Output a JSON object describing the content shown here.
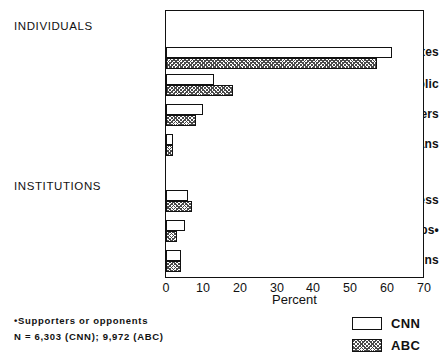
{
  "chart_data": {
    "type": "bar",
    "orientation": "horizontal",
    "title": "",
    "xlabel": "Percent",
    "ylabel": "",
    "xlim": [
      0,
      70
    ],
    "xticks": [
      0,
      10,
      20,
      30,
      40,
      50,
      60,
      70
    ],
    "grid": false,
    "legend_position": "bottom-right",
    "groups": [
      {
        "heading": "INDIVIDUALS",
        "categories": [
          "Candidates",
          "Voters/Public",
          "Campaign Workers",
          "Nonpartisans"
        ]
      },
      {
        "heading": "INSTITUTIONS",
        "categories": [
          "Press",
          "Organized Groups•",
          "Campaigns"
        ]
      }
    ],
    "categories": [
      "Candidates",
      "Voters/Public",
      "Campaign Workers",
      "Nonpartisans",
      "Press",
      "Organized Groups•",
      "Campaigns"
    ],
    "series": [
      {
        "name": "CNN",
        "values": [
          61,
          13,
          10,
          2,
          6,
          5,
          4
        ]
      },
      {
        "name": "ABC",
        "values": [
          57,
          18,
          8,
          2,
          7,
          3,
          4
        ]
      }
    ]
  },
  "labels": {
    "group_individuals": "INDIVIDUALS",
    "group_institutions": "INSTITUTIONS",
    "cat_candidates": "Candidates",
    "cat_voters_public": "Voters/Public",
    "cat_campaign_workers": "Campaign Workers",
    "cat_nonpartisans": "Nonpartisans",
    "cat_press": "Press",
    "cat_organized_groups": "Organized Groups•",
    "cat_campaigns": "Campaigns",
    "xaxis_title": "Percent"
  },
  "xticks": {
    "t0": "0",
    "t1": "10",
    "t2": "20",
    "t3": "30",
    "t4": "40",
    "t5": "50",
    "t6": "60",
    "t7": "70"
  },
  "legend": {
    "cnn": "CNN",
    "abc": "ABC"
  },
  "footnotes": {
    "line1": "•Supporters or opponents",
    "line2": "N = 6,303 (CNN); 9,972 (ABC)"
  },
  "colors": {
    "ink": "#111111",
    "cnn_fill": "#ffffff",
    "abc_hatch": "#4a4a4a",
    "background": "#ffffff"
  }
}
